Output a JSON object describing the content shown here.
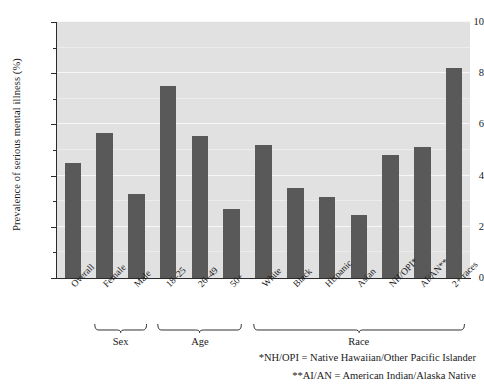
{
  "chart_data": {
    "type": "bar",
    "title": "",
    "subtitle": "",
    "xlabel": "",
    "ylabel": "Prevalence of serious mental illness (%)",
    "ylim": [
      0,
      10
    ],
    "ytick_labels": [
      "0",
      "2",
      "4",
      "6",
      "8",
      "10"
    ],
    "ytick_values": [
      0,
      2,
      4,
      6,
      8,
      10
    ],
    "minor_ticks": [
      1,
      3,
      5,
      7,
      9
    ],
    "grid": true,
    "grid_axis": "y",
    "legend": "none",
    "bar_color": "#595959",
    "plot_background": "#e1e1e1",
    "gridline_color": "#f7f7f7",
    "categories": [
      "Overall",
      "Female",
      "Male",
      "18–25",
      "26–49",
      "50+",
      "White",
      "Black",
      "Hispanic",
      "Asian",
      "NH/OPI*",
      "AI/AN**",
      "2+ races"
    ],
    "values": [
      4.5,
      5.65,
      3.3,
      7.5,
      5.55,
      2.7,
      5.2,
      3.5,
      3.15,
      2.45,
      4.8,
      5.1,
      8.2
    ],
    "groups": [
      {
        "label": "Sex",
        "categories": [
          "Female",
          "Male"
        ]
      },
      {
        "label": "Age",
        "categories": [
          "18–25",
          "26–49",
          "50+"
        ]
      },
      {
        "label": "Race",
        "categories": [
          "White",
          "Black",
          "Hispanic",
          "Asian",
          "NH/OPI*",
          "AI/AN**",
          "2+ races"
        ]
      }
    ],
    "annotations": [
      "*NH/OPI = Native Hawaiian/Other Pacific Islander",
      "**AI/AN = American Indian/Alaska Native"
    ]
  },
  "footnotes": {
    "nh_opi": "*NH/OPI = Native Hawaiian/Other Pacific Islander",
    "ai_an": "**AI/AN = American Indian/Alaska Native"
  },
  "group_labels": {
    "sex": "Sex",
    "age": "Age",
    "race": "Race"
  }
}
